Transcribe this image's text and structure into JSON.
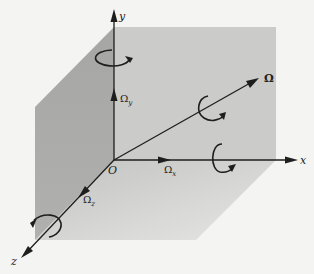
{
  "diagram": {
    "axes": {
      "x_label": "x",
      "y_label": "y",
      "z_label": "z",
      "origin_label": "O"
    },
    "vectors": {
      "omega_label": "Ω",
      "omega_x_label": "Ω",
      "omega_x_sub": "x",
      "omega_y_label": "Ω",
      "omega_y_sub": "y",
      "omega_z_label": "Ω",
      "omega_z_sub": "z"
    },
    "colors": {
      "background": "#f4f4f2",
      "back_plane": "#c9c9c7",
      "left_plane": "#a3a3a1",
      "floor_plane": "#d6d6d4",
      "lines": "#1e1e1e"
    }
  }
}
